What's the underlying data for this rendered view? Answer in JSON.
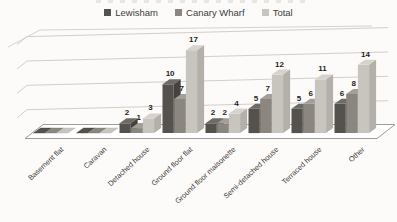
{
  "chart_data": {
    "type": "bar",
    "subtype": "3d-clustered-column",
    "title": "",
    "categories": [
      "Basement flat",
      "Caravan",
      "Detached house",
      "Ground floor flat",
      "Ground floor maisonette",
      "Semi-detached house",
      "Terraced house",
      "Other"
    ],
    "series": [
      {
        "name": "Lewisham",
        "values": [
          0,
          0,
          2,
          10,
          2,
          5,
          5,
          6
        ],
        "color_front": "#55524e",
        "color_top": "#6e6a65",
        "color_side": "#454240"
      },
      {
        "name": "Canary Wharf",
        "values": [
          0,
          0,
          1,
          7,
          2,
          7,
          6,
          8
        ],
        "color_front": "#8b8780",
        "color_top": "#a29e98",
        "color_side": "#76736d"
      },
      {
        "name": "Total",
        "values": [
          0,
          0,
          3,
          17,
          4,
          12,
          11,
          14
        ],
        "color_front": "#c8c5bf",
        "color_top": "#d6d3cd",
        "color_side": "#b3b0aa"
      }
    ],
    "ylim": [
      0,
      20
    ],
    "gridline_step": 5,
    "grid": true,
    "data_labels": true,
    "legend_position": "top",
    "value_axis_labels_visible": false
  },
  "style": {
    "background": "#fcfbf9",
    "gridline_color": "#d2cfca",
    "wall_edge_color": "#d6d3ce",
    "floor_fill": "#ffffff",
    "floor_stroke": "#a09d98",
    "data_label_color": "#1f1e1c",
    "category_label_color": "#3c3a37",
    "legend_text_color": "#3f3d3a"
  }
}
